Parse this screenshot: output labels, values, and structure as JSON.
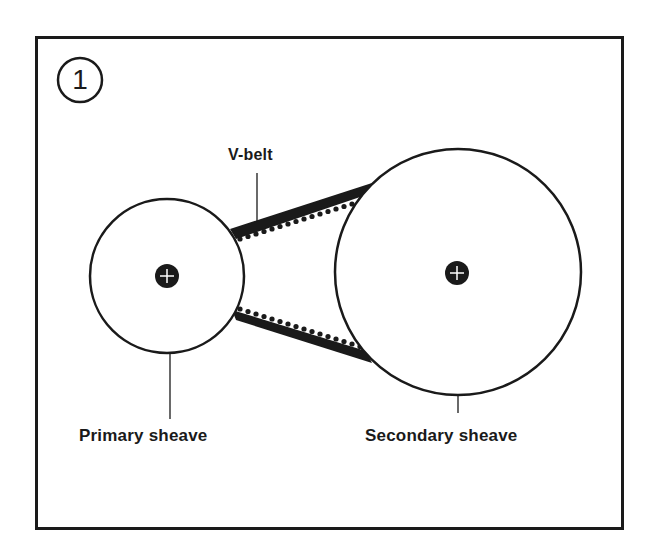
{
  "figure": {
    "number": "1",
    "labels": {
      "belt": "V-belt",
      "primary": "Primary sheave",
      "secondary": "Secondary sheave"
    }
  },
  "colors": {
    "ink": "#1a1a1a",
    "background": "#ffffff"
  },
  "components": [
    {
      "name": "primary-sheave",
      "shape": "circle",
      "center": [
        167,
        276
      ],
      "radius": 77
    },
    {
      "name": "secondary-sheave",
      "shape": "circle",
      "center": [
        458,
        272
      ],
      "radius": 123
    },
    {
      "name": "v-belt",
      "shape": "toothed-band",
      "upper_span": [
        [
          232,
          232
        ],
        [
          370,
          186
        ]
      ],
      "lower_span": [
        [
          232,
          318
        ],
        [
          370,
          362
        ]
      ]
    }
  ]
}
